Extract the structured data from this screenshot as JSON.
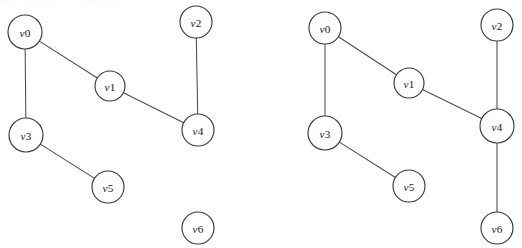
{
  "figure": {
    "background_color": "#ffffff",
    "node_fill_color": "#ffffff",
    "node_stroke_color": "#3a3a42",
    "edge_color": "#4a4a52",
    "label_color": "#18181c",
    "width": 522,
    "height": 248
  },
  "chart_data": {
    "type": "diagram",
    "title": "",
    "subtitle": "",
    "xlabel": "",
    "ylabel": "",
    "graphs": [
      {
        "name": "left-graph",
        "caption": "",
        "node_radius": 16,
        "nodes": [
          {
            "id": "v0",
            "label_var": "v",
            "label_num": "0",
            "x": 25,
            "y": 32,
            "r": 17
          },
          {
            "id": "v1",
            "label_var": "v",
            "label_num": "1",
            "x": 110,
            "y": 86,
            "r": 15
          },
          {
            "id": "v2",
            "label_var": "v",
            "label_num": "2",
            "x": 196,
            "y": 22,
            "r": 16
          },
          {
            "id": "v3",
            "label_var": "v",
            "label_num": "3",
            "x": 26,
            "y": 135,
            "r": 17
          },
          {
            "id": "v4",
            "label_var": "v",
            "label_num": "4",
            "x": 198,
            "y": 130,
            "r": 16
          },
          {
            "id": "v5",
            "label_var": "v",
            "label_num": "5",
            "x": 108,
            "y": 187,
            "r": 16
          },
          {
            "id": "v6",
            "label_var": "v",
            "label_num": "6",
            "x": 198,
            "y": 228,
            "r": 16
          }
        ],
        "edges": [
          {
            "from": "v0",
            "to": "v1"
          },
          {
            "from": "v0",
            "to": "v3"
          },
          {
            "from": "v1",
            "to": "v4"
          },
          {
            "from": "v2",
            "to": "v4"
          },
          {
            "from": "v3",
            "to": "v5"
          }
        ],
        "isolated_nodes": [
          "v6"
        ]
      },
      {
        "name": "right-graph",
        "caption": "",
        "node_radius": 16,
        "nodes": [
          {
            "id": "v0",
            "label_var": "v",
            "label_num": "0",
            "x": 325,
            "y": 28,
            "r": 16
          },
          {
            "id": "v1",
            "label_var": "v",
            "label_num": "1",
            "x": 409,
            "y": 83,
            "r": 15
          },
          {
            "id": "v2",
            "label_var": "v",
            "label_num": "2",
            "x": 497,
            "y": 25,
            "r": 16
          },
          {
            "id": "v3",
            "label_var": "v",
            "label_num": "3",
            "x": 325,
            "y": 133,
            "r": 17
          },
          {
            "id": "v4",
            "label_var": "v",
            "label_num": "4",
            "x": 497,
            "y": 126,
            "r": 17
          },
          {
            "id": "v5",
            "label_var": "v",
            "label_num": "5",
            "x": 409,
            "y": 186,
            "r": 16
          },
          {
            "id": "v6",
            "label_var": "v",
            "label_num": "6",
            "x": 497,
            "y": 228,
            "r": 16
          }
        ],
        "edges": [
          {
            "from": "v0",
            "to": "v1"
          },
          {
            "from": "v0",
            "to": "v3"
          },
          {
            "from": "v1",
            "to": "v4"
          },
          {
            "from": "v2",
            "to": "v4"
          },
          {
            "from": "v3",
            "to": "v5"
          },
          {
            "from": "v4",
            "to": "v6"
          }
        ],
        "isolated_nodes": []
      }
    ]
  }
}
